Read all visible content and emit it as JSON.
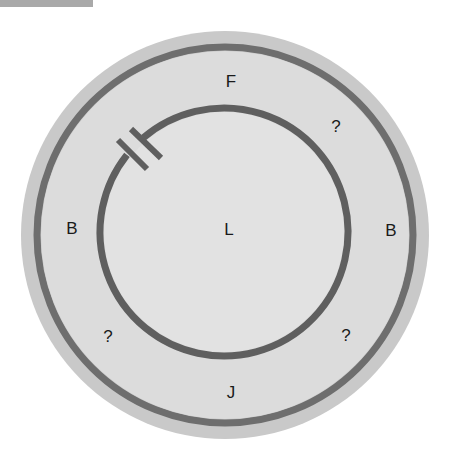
{
  "diagram": {
    "type": "concentric-circles",
    "colors": {
      "outer_fill": "#dcdcdc",
      "outer_edge": "#c8c8c8",
      "ring_stroke": "#6e6e6e",
      "inner_fill": "#e3e3e3",
      "header_bar": "#a9a9a9"
    },
    "outer_ring": {
      "labels": [
        {
          "id": "top",
          "text": "F"
        },
        {
          "id": "top-right",
          "text": "?"
        },
        {
          "id": "left",
          "text": "B"
        },
        {
          "id": "right",
          "text": "B"
        },
        {
          "id": "bottom-left",
          "text": "?"
        },
        {
          "id": "bottom-right",
          "text": "?"
        },
        {
          "id": "bottom",
          "text": "J"
        }
      ]
    },
    "inner_region": {
      "label": "L"
    },
    "inner_circle": {
      "gap_symbol": "capacitor",
      "gap_position": "upper-left"
    }
  }
}
